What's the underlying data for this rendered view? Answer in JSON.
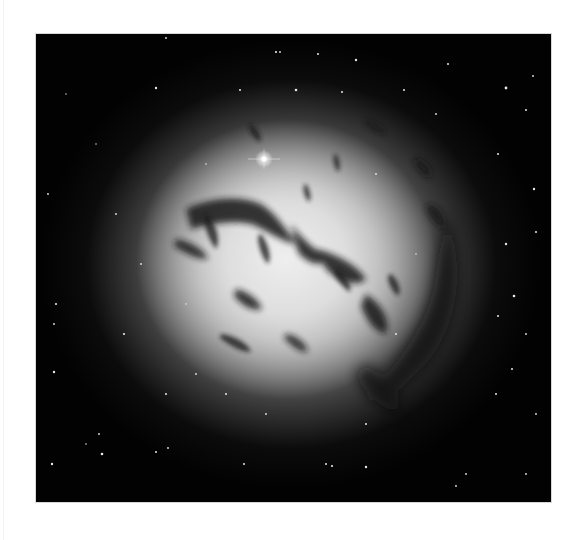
{
  "image": {
    "subject": "dusty elliptical galaxy with dark dust lanes against a star field",
    "frame": {
      "x": 36,
      "y": 34,
      "width": 515,
      "height": 468
    },
    "colors": {
      "page_background": "#ffffff",
      "sky": "#020202",
      "core": "#eeeeee",
      "dust": "#1a1a1a",
      "star": "#ffffff"
    },
    "bright_star": {
      "x": 228,
      "y": 125,
      "label": "foreground-star"
    }
  }
}
